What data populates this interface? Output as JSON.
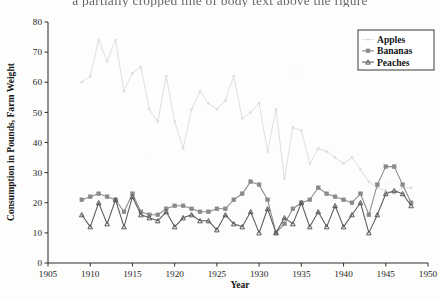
{
  "page": {
    "cropped_header_text": "a partially cropped line of body text above the figure",
    "background_color": "#fdfdfc"
  },
  "chart_data": {
    "type": "line",
    "title": "",
    "xlabel": "Year",
    "ylabel": "Consumption in Pounds, Farm Weight",
    "xlim": [
      1905,
      1950
    ],
    "ylim": [
      0,
      80
    ],
    "xticks": [
      1905,
      1910,
      1915,
      1920,
      1925,
      1930,
      1935,
      1940,
      1945,
      1950
    ],
    "yticks": [
      0,
      10,
      20,
      30,
      40,
      50,
      60,
      70,
      80
    ],
    "grid": false,
    "legend_position": "top-right",
    "x": [
      1909,
      1910,
      1911,
      1912,
      1913,
      1914,
      1915,
      1916,
      1917,
      1918,
      1919,
      1920,
      1921,
      1922,
      1923,
      1924,
      1925,
      1926,
      1927,
      1928,
      1929,
      1930,
      1931,
      1932,
      1933,
      1934,
      1935,
      1936,
      1937,
      1938,
      1939,
      1940,
      1941,
      1942,
      1943,
      1944,
      1945,
      1946,
      1947,
      1948
    ],
    "series": [
      {
        "name": "Apples",
        "color": "#dcdcdc",
        "marker": "dot",
        "values": [
          60,
          62,
          74,
          67,
          74,
          57,
          63,
          65,
          51,
          47,
          62,
          47,
          38,
          51,
          57,
          53,
          51,
          54,
          62,
          48,
          50,
          53,
          37,
          51,
          28,
          45,
          44,
          33,
          38,
          37,
          35,
          33,
          35,
          31,
          27,
          25,
          24,
          23,
          25,
          25
        ]
      },
      {
        "name": "Bananas",
        "color": "#8a8a8a",
        "marker": "square",
        "values": [
          21,
          22,
          23,
          22,
          21,
          17,
          23,
          17,
          16,
          16,
          18,
          19,
          19,
          18,
          17,
          17,
          18,
          18,
          21,
          23,
          27,
          26,
          21,
          10,
          13,
          18,
          20,
          21,
          25,
          23,
          22,
          21,
          20,
          23,
          16,
          26,
          32,
          32,
          26,
          20
        ]
      },
      {
        "name": "Peaches",
        "color": "#5a5a5a",
        "marker": "triangle",
        "values": [
          16,
          12,
          20,
          13,
          21,
          12,
          22,
          16,
          15,
          14,
          17,
          12,
          15,
          16,
          14,
          14,
          11,
          16,
          13,
          12,
          17,
          10,
          18,
          10,
          15,
          13,
          20,
          12,
          17,
          12,
          19,
          12,
          16,
          20,
          10,
          16,
          23,
          24,
          23,
          19
        ]
      }
    ]
  },
  "legend": {
    "entries": [
      {
        "label": "Apples"
      },
      {
        "label": "Bananas"
      },
      {
        "label": "Peaches"
      }
    ]
  }
}
